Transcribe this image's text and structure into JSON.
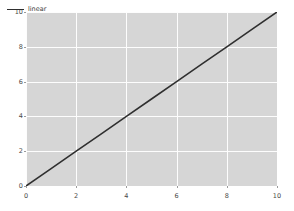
{
  "chart_data": {
    "type": "line",
    "title": "",
    "xlabel": "",
    "ylabel": "",
    "xlim": [
      0,
      10
    ],
    "ylim": [
      0,
      10
    ],
    "grid": true,
    "legend_position": "upper left",
    "xticks": [
      0,
      2,
      4,
      6,
      8,
      10
    ],
    "yticks": [
      0,
      2,
      4,
      6,
      8,
      10
    ],
    "xtick_labels": [
      "0",
      "2",
      "4",
      "6",
      "8",
      "10"
    ],
    "ytick_labels": [
      "0",
      "2",
      "4",
      "6",
      "8",
      "10"
    ],
    "series": [
      {
        "name": "linear",
        "color": "#2f2f2f",
        "linewidth": 1.6,
        "x": [
          0,
          1,
          2,
          3,
          4,
          5,
          6,
          7,
          8,
          9,
          10
        ],
        "values": [
          0,
          1,
          2,
          3,
          4,
          5,
          6,
          7,
          8,
          9,
          10
        ]
      }
    ]
  },
  "legend": {
    "entries": [
      {
        "label": "linear"
      }
    ]
  },
  "style": {
    "axes_facecolor": "#d6d6d6",
    "figure_facecolor": "#ffffff",
    "gridcolor": "#fdfdfd",
    "tick_color": "#4a4a4a"
  }
}
